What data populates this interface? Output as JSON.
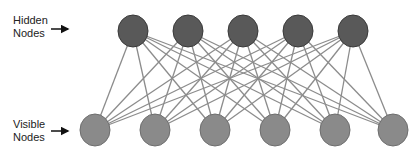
{
  "diagram": {
    "type": "bipartite-network",
    "colors": {
      "hidden_fill": "#595959",
      "hidden_stroke": "#3a3a3a",
      "visible_fill": "#8a8a8a",
      "visible_stroke": "#6e6e6e",
      "edge": "#8c8c8c",
      "arrow": "#111111"
    },
    "labels": {
      "hidden": {
        "line1": "Hidden",
        "line2": "Nodes"
      },
      "visible": {
        "line1": "Visible",
        "line2": "Nodes"
      }
    },
    "hidden_nodes": [
      {
        "id": "h1",
        "x": 133,
        "y": 31
      },
      {
        "id": "h2",
        "x": 188,
        "y": 31
      },
      {
        "id": "h3",
        "x": 243,
        "y": 31
      },
      {
        "id": "h4",
        "x": 298,
        "y": 31
      },
      {
        "id": "h5",
        "x": 353,
        "y": 31
      }
    ],
    "visible_nodes": [
      {
        "id": "v1",
        "x": 95,
        "y": 130
      },
      {
        "id": "v2",
        "x": 155,
        "y": 130
      },
      {
        "id": "v3",
        "x": 215,
        "y": 130
      },
      {
        "id": "v4",
        "x": 275,
        "y": 130
      },
      {
        "id": "v5",
        "x": 335,
        "y": 130
      },
      {
        "id": "v6",
        "x": 393,
        "y": 130
      }
    ],
    "node_radius": 15,
    "connectivity": "fully-connected"
  }
}
